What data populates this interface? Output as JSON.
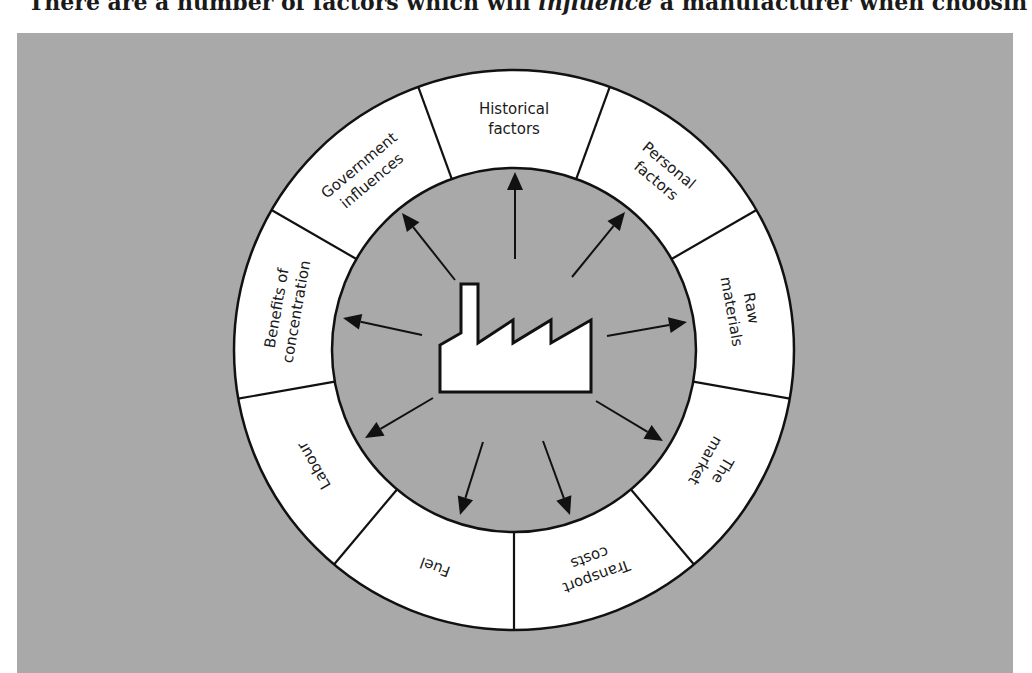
{
  "top_text": {
    "before": "There are a number of factors which will ",
    "emphasis": "influence",
    "after": " a manufacturer when choosing"
  },
  "diagram": {
    "center": {
      "x": 514,
      "y": 350
    },
    "outer_radius": 280,
    "inner_radius": 182,
    "background_color": "#a9a9a9",
    "ring_color": "#ffffff",
    "stroke_color": "#111111",
    "central_icon": "factory-icon",
    "segments": [
      {
        "id": "historical",
        "lines": [
          "Historical",
          "factors"
        ],
        "angle": 270
      },
      {
        "id": "personal",
        "lines": [
          "Personal",
          "factors"
        ],
        "angle": 310
      },
      {
        "id": "raw-materials",
        "lines": [
          "Raw",
          "materials"
        ],
        "angle": 350
      },
      {
        "id": "market",
        "lines": [
          "The",
          "market"
        ],
        "angle": 30
      },
      {
        "id": "transport",
        "lines": [
          "Transport",
          "costs"
        ],
        "angle": 70
      },
      {
        "id": "fuel",
        "lines": [
          "Fuel"
        ],
        "angle": 110
      },
      {
        "id": "labour",
        "lines": [
          "Labour"
        ],
        "angle": 150
      },
      {
        "id": "concentration",
        "lines": [
          "Benefits of",
          "concentration"
        ],
        "angle": 190
      },
      {
        "id": "government",
        "lines": [
          "Government",
          "influences"
        ],
        "angle": 230
      }
    ],
    "arrows": [
      {
        "from": [
          515,
          259
        ],
        "to": [
          515,
          172
        ]
      },
      {
        "from": [
          572,
          277
        ],
        "to": [
          625,
          212
        ]
      },
      {
        "from": [
          607,
          336
        ],
        "to": [
          687,
          322
        ]
      },
      {
        "from": [
          596,
          401
        ],
        "to": [
          663,
          441
        ]
      },
      {
        "from": [
          543,
          441
        ],
        "to": [
          570,
          515
        ]
      },
      {
        "from": [
          483,
          442
        ],
        "to": [
          460,
          515
        ]
      },
      {
        "from": [
          433,
          398
        ],
        "to": [
          365,
          438
        ]
      },
      {
        "from": [
          422,
          335
        ],
        "to": [
          343,
          318
        ]
      },
      {
        "from": [
          455,
          280
        ],
        "to": [
          402,
          213
        ]
      }
    ]
  }
}
